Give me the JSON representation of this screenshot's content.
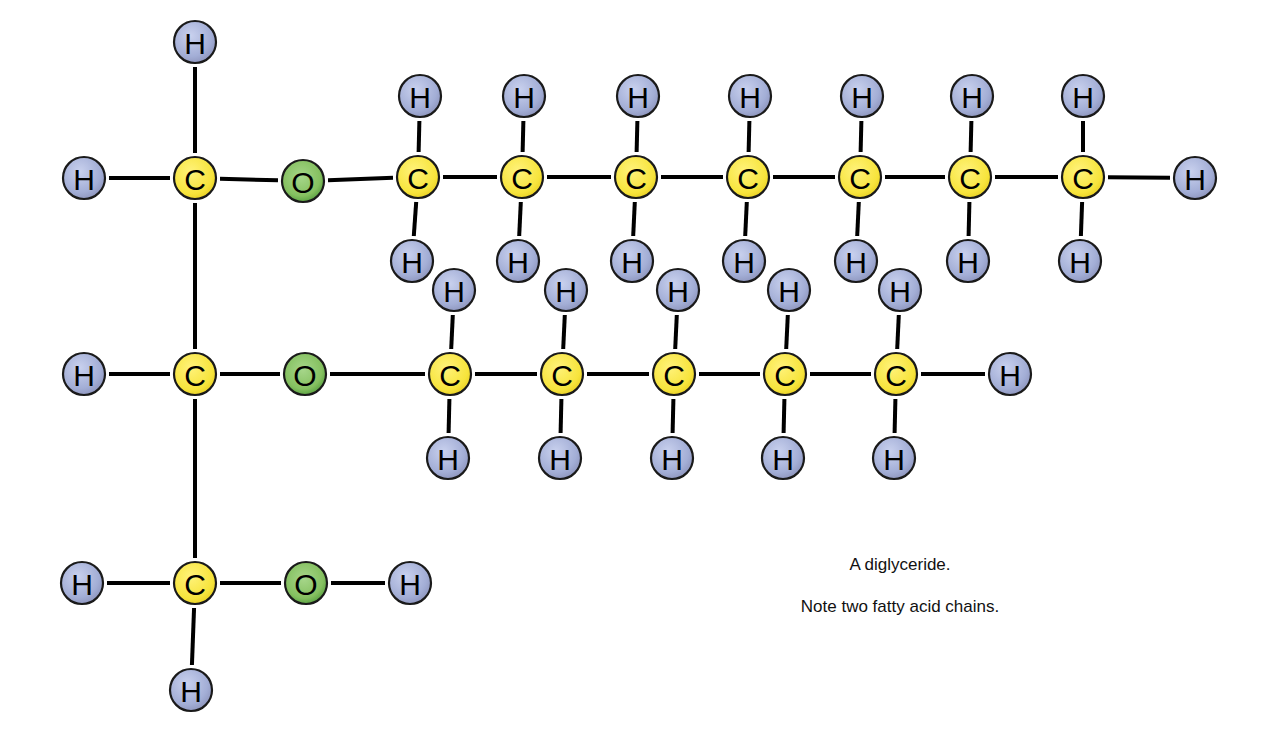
{
  "diagram": {
    "title": "A diglyceride.",
    "subtitle": "Note two fatty acid chains.",
    "colors": {
      "carbon": "#f5e342",
      "oxygen": "#7fbf5a",
      "hydrogen": "#a9b4d8",
      "bond": "#000000",
      "outline": "#1a1a1a"
    },
    "atom_radius": 21,
    "atoms": [
      {
        "id": "g1c",
        "el": "C",
        "label": "C",
        "x": 195,
        "y": 178
      },
      {
        "id": "g1h_top",
        "el": "H",
        "label": "H",
        "x": 195,
        "y": 42
      },
      {
        "id": "g1h_left",
        "el": "H",
        "label": "H",
        "x": 84,
        "y": 178
      },
      {
        "id": "o1",
        "el": "O",
        "label": "O",
        "x": 303,
        "y": 181
      },
      {
        "id": "t1",
        "el": "C",
        "label": "C",
        "x": 418,
        "y": 177
      },
      {
        "id": "t2",
        "el": "C",
        "label": "C",
        "x": 522,
        "y": 177
      },
      {
        "id": "t3",
        "el": "C",
        "label": "C",
        "x": 636,
        "y": 177
      },
      {
        "id": "t4",
        "el": "C",
        "label": "C",
        "x": 748,
        "y": 177
      },
      {
        "id": "t5",
        "el": "C",
        "label": "C",
        "x": 860,
        "y": 177
      },
      {
        "id": "t6",
        "el": "C",
        "label": "C",
        "x": 970,
        "y": 177
      },
      {
        "id": "t7",
        "el": "C",
        "label": "C",
        "x": 1083,
        "y": 177
      },
      {
        "id": "t1u",
        "el": "H",
        "label": "H",
        "x": 420,
        "y": 96
      },
      {
        "id": "t2u",
        "el": "H",
        "label": "H",
        "x": 524,
        "y": 96
      },
      {
        "id": "t3u",
        "el": "H",
        "label": "H",
        "x": 638,
        "y": 96
      },
      {
        "id": "t4u",
        "el": "H",
        "label": "H",
        "x": 750,
        "y": 96
      },
      {
        "id": "t5u",
        "el": "H",
        "label": "H",
        "x": 862,
        "y": 96
      },
      {
        "id": "t6u",
        "el": "H",
        "label": "H",
        "x": 972,
        "y": 96
      },
      {
        "id": "t7u",
        "el": "H",
        "label": "H",
        "x": 1083,
        "y": 96
      },
      {
        "id": "t7r",
        "el": "H",
        "label": "H",
        "x": 1195,
        "y": 178
      },
      {
        "id": "g2c",
        "el": "C",
        "label": "C",
        "x": 195,
        "y": 374
      },
      {
        "id": "g2h",
        "el": "H",
        "label": "H",
        "x": 84,
        "y": 374
      },
      {
        "id": "o2",
        "el": "O",
        "label": "O",
        "x": 305,
        "y": 374
      },
      {
        "id": "m1",
        "el": "C",
        "label": "C",
        "x": 450,
        "y": 374
      },
      {
        "id": "m2",
        "el": "C",
        "label": "C",
        "x": 562,
        "y": 374
      },
      {
        "id": "m3",
        "el": "C",
        "label": "C",
        "x": 674,
        "y": 374
      },
      {
        "id": "m4",
        "el": "C",
        "label": "C",
        "x": 785,
        "y": 374
      },
      {
        "id": "m5",
        "el": "C",
        "label": "C",
        "x": 896,
        "y": 374
      },
      {
        "id": "m1u",
        "el": "H",
        "label": "H",
        "x": 454,
        "y": 290
      },
      {
        "id": "m2u",
        "el": "H",
        "label": "H",
        "x": 566,
        "y": 290
      },
      {
        "id": "m3u",
        "el": "H",
        "label": "H",
        "x": 678,
        "y": 290
      },
      {
        "id": "m4u",
        "el": "H",
        "label": "H",
        "x": 789,
        "y": 290
      },
      {
        "id": "m5u",
        "el": "H",
        "label": "H",
        "x": 900,
        "y": 290
      },
      {
        "id": "t1d",
        "el": "H",
        "label": "H",
        "x": 412,
        "y": 261
      },
      {
        "id": "t2d",
        "el": "H",
        "label": "H",
        "x": 518,
        "y": 261
      },
      {
        "id": "t3d",
        "el": "H",
        "label": "H",
        "x": 632,
        "y": 261
      },
      {
        "id": "t4d",
        "el": "H",
        "label": "H",
        "x": 744,
        "y": 261
      },
      {
        "id": "t5d",
        "el": "H",
        "label": "H",
        "x": 856,
        "y": 261
      },
      {
        "id": "t6d",
        "el": "H",
        "label": "H",
        "x": 968,
        "y": 261
      },
      {
        "id": "t7d",
        "el": "H",
        "label": "H",
        "x": 1080,
        "y": 261
      },
      {
        "id": "m1d",
        "el": "H",
        "label": "H",
        "x": 448,
        "y": 458
      },
      {
        "id": "m2d",
        "el": "H",
        "label": "H",
        "x": 560,
        "y": 458
      },
      {
        "id": "m3d",
        "el": "H",
        "label": "H",
        "x": 672,
        "y": 458
      },
      {
        "id": "m4d",
        "el": "H",
        "label": "H",
        "x": 783,
        "y": 458
      },
      {
        "id": "m5d",
        "el": "H",
        "label": "H",
        "x": 894,
        "y": 458
      },
      {
        "id": "m5r",
        "el": "H",
        "label": "H",
        "x": 1010,
        "y": 374
      },
      {
        "id": "g3c",
        "el": "C",
        "label": "C",
        "x": 195,
        "y": 583
      },
      {
        "id": "g3h_left",
        "el": "H",
        "label": "H",
        "x": 82,
        "y": 583
      },
      {
        "id": "g3h_down",
        "el": "H",
        "label": "H",
        "x": 191,
        "y": 690
      },
      {
        "id": "o3",
        "el": "O",
        "label": "O",
        "x": 306,
        "y": 583
      },
      {
        "id": "o3h",
        "el": "H",
        "label": "H",
        "x": 410,
        "y": 583
      }
    ],
    "bonds": [
      [
        "g1c",
        "g1h_top"
      ],
      [
        "g1c",
        "g1h_left"
      ],
      [
        "g1c",
        "o1"
      ],
      [
        "o1",
        "t1"
      ],
      [
        "t1",
        "t2"
      ],
      [
        "t2",
        "t3"
      ],
      [
        "t3",
        "t4"
      ],
      [
        "t4",
        "t5"
      ],
      [
        "t5",
        "t6"
      ],
      [
        "t6",
        "t7"
      ],
      [
        "t7",
        "t7r"
      ],
      [
        "t1",
        "t1u"
      ],
      [
        "t2",
        "t2u"
      ],
      [
        "t3",
        "t3u"
      ],
      [
        "t4",
        "t4u"
      ],
      [
        "t5",
        "t5u"
      ],
      [
        "t6",
        "t6u"
      ],
      [
        "t7",
        "t7u"
      ],
      [
        "t1",
        "t1d"
      ],
      [
        "t2",
        "t2d"
      ],
      [
        "t3",
        "t3d"
      ],
      [
        "t4",
        "t4d"
      ],
      [
        "t5",
        "t5d"
      ],
      [
        "t6",
        "t6d"
      ],
      [
        "t7",
        "t7d"
      ],
      [
        "g1c",
        "g2c"
      ],
      [
        "g2c",
        "g2h"
      ],
      [
        "g2c",
        "o2"
      ],
      [
        "o2",
        "m1"
      ],
      [
        "m1",
        "m2"
      ],
      [
        "m2",
        "m3"
      ],
      [
        "m3",
        "m4"
      ],
      [
        "m4",
        "m5"
      ],
      [
        "m5",
        "m5r"
      ],
      [
        "m1",
        "m1u"
      ],
      [
        "m2",
        "m2u"
      ],
      [
        "m3",
        "m3u"
      ],
      [
        "m4",
        "m4u"
      ],
      [
        "m5",
        "m5u"
      ],
      [
        "m1",
        "m1d"
      ],
      [
        "m2",
        "m2d"
      ],
      [
        "m3",
        "m3d"
      ],
      [
        "m4",
        "m4d"
      ],
      [
        "m5",
        "m5d"
      ],
      [
        "g2c",
        "g3c"
      ],
      [
        "g3c",
        "g3h_left"
      ],
      [
        "g3c",
        "g3h_down"
      ],
      [
        "g3c",
        "o3"
      ],
      [
        "o3",
        "o3h"
      ]
    ]
  }
}
